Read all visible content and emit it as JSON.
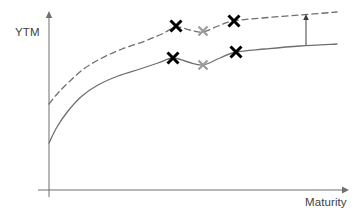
{
  "chart_data": {
    "type": "line",
    "title": "",
    "xlabel": "Maturity",
    "ylabel": "YTM",
    "grid": false,
    "legend": null,
    "axes": {
      "x_axis_line": {
        "x1": 38,
        "y": 190,
        "x2": 348,
        "arrow": "right"
      },
      "y_axis_line": {
        "x": 49,
        "y1": 197,
        "y2": 11,
        "arrow": "up"
      },
      "x_range_note": "unlabeled, increasing maturity to the right",
      "y_range_note": "unlabeled, increasing yield upward"
    },
    "series": [
      {
        "name": "lower-yield-curve",
        "style": "solid",
        "color": "#6f6f6f",
        "points": [
          {
            "x": 49,
            "y": 143
          },
          {
            "x": 57,
            "y": 127
          },
          {
            "x": 68,
            "y": 111
          },
          {
            "x": 82,
            "y": 96
          },
          {
            "x": 98,
            "y": 85
          },
          {
            "x": 118,
            "y": 76
          },
          {
            "x": 140,
            "y": 69
          },
          {
            "x": 158,
            "y": 63
          },
          {
            "x": 173,
            "y": 58
          },
          {
            "x": 188,
            "y": 62
          },
          {
            "x": 203,
            "y": 65
          },
          {
            "x": 220,
            "y": 58
          },
          {
            "x": 236,
            "y": 52
          },
          {
            "x": 265,
            "y": 49
          },
          {
            "x": 300,
            "y": 46
          },
          {
            "x": 337,
            "y": 44
          }
        ]
      },
      {
        "name": "upper-yield-curve",
        "style": "dashed",
        "color": "#6f6f6f",
        "points": [
          {
            "x": 49,
            "y": 104
          },
          {
            "x": 58,
            "y": 93
          },
          {
            "x": 70,
            "y": 81
          },
          {
            "x": 85,
            "y": 68
          },
          {
            "x": 102,
            "y": 58
          },
          {
            "x": 122,
            "y": 49
          },
          {
            "x": 145,
            "y": 41
          },
          {
            "x": 162,
            "y": 34
          },
          {
            "x": 176,
            "y": 27
          },
          {
            "x": 190,
            "y": 30
          },
          {
            "x": 203,
            "y": 32
          },
          {
            "x": 218,
            "y": 26
          },
          {
            "x": 233,
            "y": 21
          },
          {
            "x": 262,
            "y": 18
          },
          {
            "x": 300,
            "y": 15
          },
          {
            "x": 337,
            "y": 12
          }
        ]
      }
    ],
    "markers": [
      {
        "name": "marker-upper-left",
        "x": 176,
        "y": 26,
        "color": "#000000",
        "size": 11,
        "weight": 3.0,
        "symbol": "x"
      },
      {
        "name": "marker-upper-middle",
        "x": 203,
        "y": 31,
        "color": "#9b9b9b",
        "size": 9,
        "weight": 2.2,
        "symbol": "x"
      },
      {
        "name": "marker-upper-right",
        "x": 234,
        "y": 21,
        "color": "#000000",
        "size": 11,
        "weight": 3.0,
        "symbol": "x"
      },
      {
        "name": "marker-lower-left",
        "x": 173,
        "y": 58,
        "color": "#000000",
        "size": 11,
        "weight": 3.0,
        "symbol": "x"
      },
      {
        "name": "marker-lower-middle",
        "x": 203,
        "y": 65,
        "color": "#9b9b9b",
        "size": 9,
        "weight": 2.2,
        "symbol": "x"
      },
      {
        "name": "marker-lower-right",
        "x": 236,
        "y": 52,
        "color": "#000000",
        "size": 11,
        "weight": 3.0,
        "symbol": "x"
      }
    ],
    "annotations": [
      {
        "name": "shift-arrow",
        "type": "vertical-arrow",
        "x": 306,
        "y_from": 45,
        "y_to": 14,
        "direction": "up",
        "color": "#3f3f3f",
        "label": ""
      }
    ]
  },
  "labels": {
    "ytm": "YTM",
    "maturity": "Maturity"
  },
  "colors": {
    "background": "#ffffff",
    "axis": "#6f6f6f",
    "curve": "#6f6f6f",
    "marker_black": "#000000",
    "marker_gray": "#9b9b9b",
    "text": "#3f3f3f"
  }
}
